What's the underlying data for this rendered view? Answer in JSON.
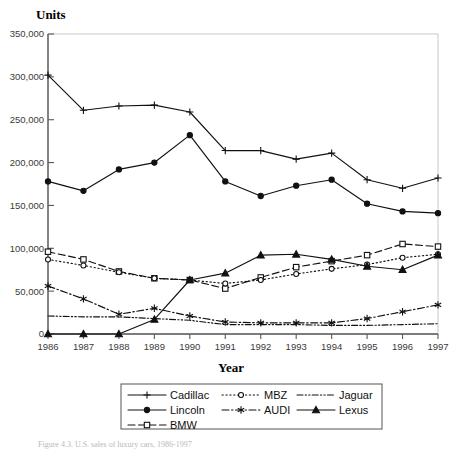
{
  "figure": {
    "caption": "Figure 4.3. U.S. sales of luxury cars, 1986-1997",
    "width": 463,
    "height": 452
  },
  "chart_data": {
    "type": "line",
    "title": "",
    "xlabel": "Year",
    "ylabel": "Units",
    "x": [
      1986,
      1987,
      1988,
      1989,
      1990,
      1991,
      1992,
      1993,
      1994,
      1995,
      1996,
      1997
    ],
    "categories": [
      "1986",
      "1987",
      "1988",
      "1989",
      "1990",
      "1991",
      "1992",
      "1993",
      "1994",
      "1995",
      "1996",
      "1997"
    ],
    "xlim": [
      1986,
      1997
    ],
    "ylim": [
      0,
      350000
    ],
    "ytick_labels": [
      "0",
      "50,000",
      "100,000",
      "150,000",
      "200,000",
      "250,000",
      "300,000",
      "350,000"
    ],
    "ytick_values": [
      0,
      50000,
      100000,
      150000,
      200000,
      250000,
      300000,
      350000
    ],
    "grid": false,
    "legend_position": "bottom",
    "series": [
      {
        "name": "Cadillac",
        "marker": "plus",
        "dash": "solid",
        "values": [
          302000,
          261000,
          266000,
          267000,
          259000,
          214000,
          214000,
          204000,
          211000,
          180000,
          170000,
          182000
        ]
      },
      {
        "name": "Lincoln",
        "marker": "circle-filled",
        "dash": "solid",
        "values": [
          178000,
          167000,
          192000,
          200000,
          232000,
          178000,
          161000,
          173000,
          180000,
          152000,
          143000,
          141000
        ]
      },
      {
        "name": "BMW",
        "marker": "square-open",
        "dash": "dashed",
        "values": [
          96000,
          87000,
          73000,
          65000,
          63000,
          53000,
          66000,
          78000,
          85000,
          92000,
          105000,
          102000
        ]
      },
      {
        "name": "MBZ",
        "marker": "circle-open",
        "dash": "dotted",
        "values": [
          87000,
          80000,
          72000,
          65000,
          63000,
          59000,
          63000,
          70000,
          76000,
          81000,
          89000,
          93000
        ]
      },
      {
        "name": "Lexus",
        "marker": "triangle-filled",
        "dash": "solid",
        "values": [
          0,
          0,
          0,
          17000,
          63000,
          71000,
          92000,
          93000,
          87000,
          79000,
          75000,
          92000
        ]
      },
      {
        "name": "AUDI",
        "marker": "asterisk",
        "dash": "dash-dot",
        "values": [
          56000,
          41000,
          23000,
          30000,
          21000,
          14000,
          13000,
          13000,
          13000,
          18000,
          26000,
          34000
        ]
      },
      {
        "name": "Jaguar",
        "marker": "none",
        "dash": "dash-dot-dot",
        "values": [
          21000,
          20000,
          20000,
          18000,
          16000,
          11000,
          11000,
          11000,
          10000,
          10000,
          11000,
          12000
        ]
      }
    ],
    "legend_entries": [
      {
        "label": "Cadillac",
        "marker": "plus",
        "dash": "solid"
      },
      {
        "label": "MBZ",
        "marker": "circle-open",
        "dash": "dotted"
      },
      {
        "label": "Jaguar",
        "marker": "none",
        "dash": "dash-dot-dot"
      },
      {
        "label": "Lincoln",
        "marker": "circle-filled",
        "dash": "solid"
      },
      {
        "label": "AUDI",
        "marker": "asterisk",
        "dash": "dash-dot"
      },
      {
        "label": "Lexus",
        "marker": "triangle-filled",
        "dash": "solid"
      },
      {
        "label": "BMW",
        "marker": "square-open",
        "dash": "dashed"
      }
    ]
  }
}
